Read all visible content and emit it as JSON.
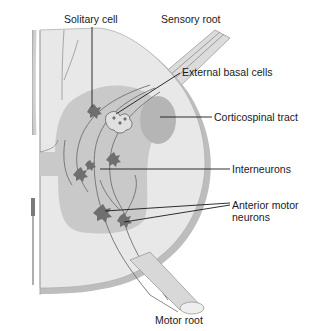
{
  "diagram": {
    "labels": {
      "solitary_cell": "Solitary cell",
      "sensory_root": "Sensory root",
      "external_basal_cells": "External basal cells",
      "corticospinal_tract": "Corticospinal tract",
      "interneurons": "Interneurons",
      "anterior_motor_line1": "Anterior motor",
      "anterior_motor_line2": "neurons",
      "motor_root": "Motor root"
    },
    "colors": {
      "white_matter": "#e8e8e8",
      "gray_matter": "#c9c9c9",
      "tract": "#b5b5b5",
      "neuron": "#6f6f6f",
      "outline": "#a8a8a8",
      "leader_line": "#1a1a1a"
    }
  }
}
